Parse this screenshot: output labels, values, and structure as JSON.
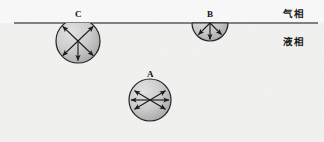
{
  "figure": {
    "width": 324,
    "height": 142,
    "background_color": "#f1f1f0",
    "liquid_color": "#efefee",
    "gas_color": "#fbfbfb",
    "interface": {
      "label": "gas-liquid interface line",
      "x_start": 14,
      "x_end": 318,
      "y": 23,
      "color": "#5a5a5a",
      "thickness": 1.4
    },
    "phases": [
      {
        "id": "gas",
        "label": "气相",
        "position": "above-interface"
      },
      {
        "id": "liquid",
        "label": "液相",
        "position": "below-interface"
      }
    ],
    "molecules": [
      {
        "id": "C",
        "label": "C",
        "cx": 78,
        "cy": 41,
        "r": 22,
        "clipped_at_interface": true,
        "arrow_count": 5,
        "arrow_angles_deg": [
          210,
          330,
          135,
          45,
          90
        ],
        "description": "molecule partially at surface, unbalanced downward net force",
        "fill_light": "#d9d9d9",
        "fill_dark": "#9e9e9e",
        "stroke": "#222222"
      },
      {
        "id": "B",
        "label": "B",
        "cx": 210,
        "cy": 23,
        "r": 18,
        "clipped_at_interface": true,
        "arrow_count": 3,
        "arrow_angles_deg": [
          135,
          90,
          45
        ],
        "description": "molecule at the surface, forces only from liquid below",
        "fill_light": "#d9d9d9",
        "fill_dark": "#9e9e9e",
        "stroke": "#222222"
      },
      {
        "id": "A",
        "label": "A",
        "cx": 150,
        "cy": 100,
        "r": 21,
        "clipped_at_interface": false,
        "arrow_count": 6,
        "arrow_angles_deg": [
          210,
          330,
          180,
          0,
          135,
          45
        ],
        "description": "molecule in bulk liquid, forces balanced in all directions",
        "fill_light": "#d9d9d9",
        "fill_dark": "#9e9e9e",
        "stroke": "#222222"
      }
    ],
    "arrow_color": "#1c1c1c"
  }
}
